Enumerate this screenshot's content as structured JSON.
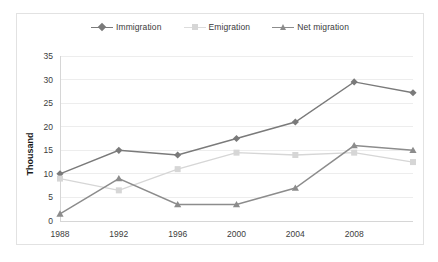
{
  "chart_data": {
    "type": "line",
    "title": "",
    "xlabel": "",
    "ylabel": "Thousand",
    "categories": [
      "1988",
      "1992",
      "1996",
      "2000",
      "2004",
      "2008",
      ""
    ],
    "x_tick_labels": [
      "1988",
      "1992",
      "1996",
      "2000",
      "2004",
      "2008"
    ],
    "ylim": [
      0,
      35
    ],
    "y_ticks": [
      0,
      5,
      10,
      15,
      20,
      25,
      30,
      35
    ],
    "grid": true,
    "legend_position": "top-center",
    "series": [
      {
        "name": "Immigration",
        "marker": "diamond",
        "color": "#7a7a7a",
        "values": [
          10,
          15,
          14,
          17.5,
          21,
          29.5,
          27.2
        ]
      },
      {
        "name": "Emigration",
        "marker": "square",
        "color": "#d6d6d6",
        "values": [
          9,
          6.5,
          11,
          14.5,
          14,
          14.5,
          12.5
        ]
      },
      {
        "name": "Net migration",
        "marker": "triangle",
        "color": "#8c8c8c",
        "values": [
          1.5,
          9,
          3.5,
          3.5,
          7,
          16,
          15
        ]
      }
    ]
  },
  "legend": {
    "items": [
      {
        "label": "Immigration"
      },
      {
        "label": "Emigration"
      },
      {
        "label": "Net migration"
      }
    ]
  },
  "axis": {
    "y_label": "Thousand"
  },
  "colors": {
    "background": "#ffffff",
    "frame_border": "#e2e2e2",
    "gridline": "#ededed",
    "axis_text": "#3c3c3c"
  }
}
